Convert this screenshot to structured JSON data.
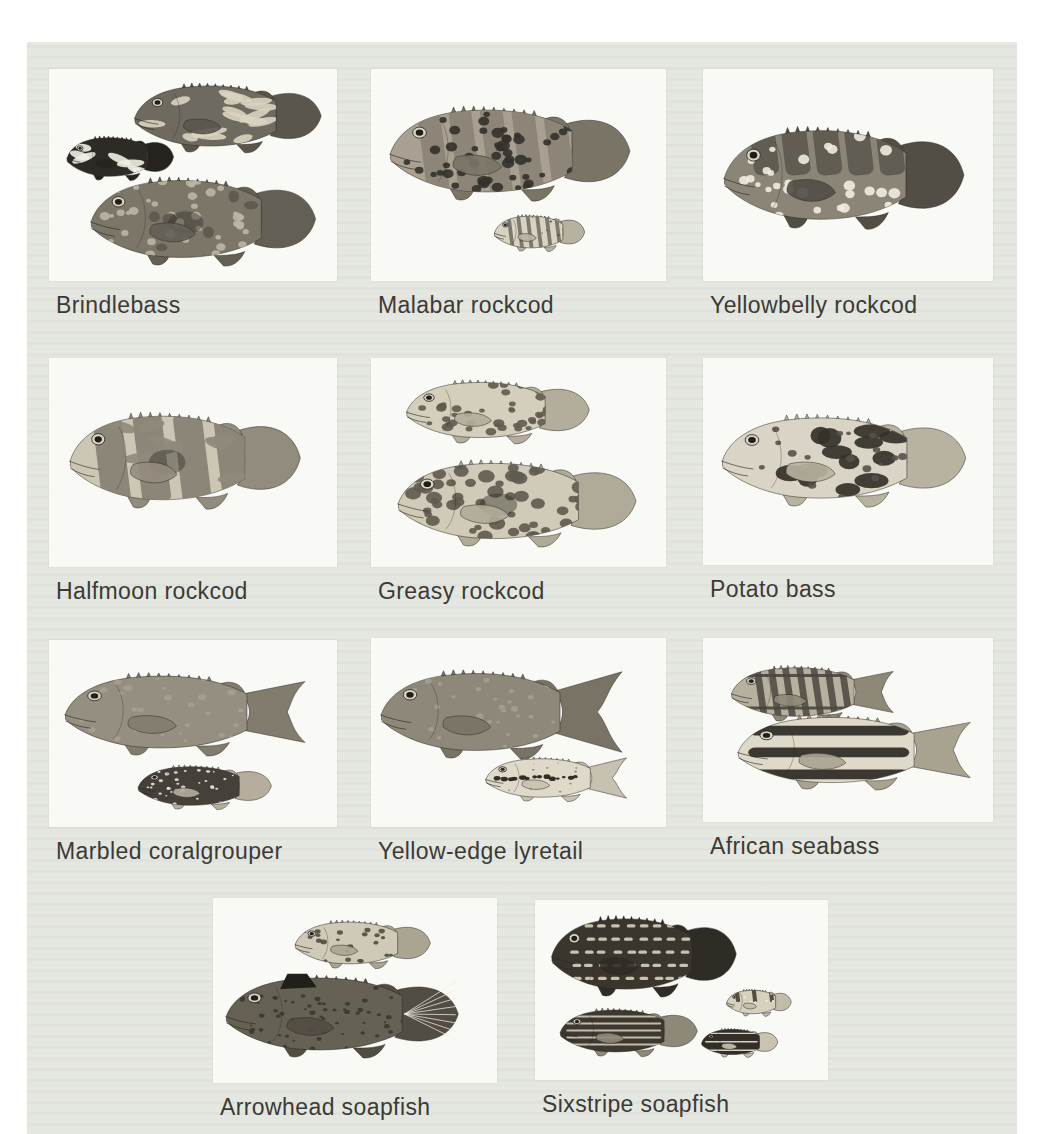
{
  "page": {
    "kind": "field-guide plate of fish illustrations",
    "margin_color": "#ffffff",
    "plate_background": "#e4e6e0",
    "panel_background": "#f9f9f6",
    "caption_color": "#3b3a35"
  },
  "species": [
    {
      "label": "Brindlebass",
      "panel": {
        "x": 49,
        "y": 69,
        "w": 288,
        "h": 212
      },
      "fish": [
        {
          "cx": 182,
          "cy": 47,
          "len": 196,
          "ht": 72,
          "tail": "round",
          "body": "#6e6a60",
          "fins": "#5a564d",
          "patterns": [
            {
              "t": "marble",
              "c": "#d9d3c1",
              "n": 18,
              "s": 5
            }
          ]
        },
        {
          "cx": 73,
          "cy": 88,
          "len": 112,
          "ht": 46,
          "tail": "round",
          "body": "#2e2b26",
          "fins": "#26231f",
          "patterns": [
            {
              "t": "marble",
              "c": "#f1eee4",
              "n": 7,
              "s": 8
            }
          ]
        },
        {
          "cx": 158,
          "cy": 150,
          "len": 236,
          "ht": 92,
          "tail": "round",
          "body": "#7c7669",
          "fins": "#645f54",
          "patterns": [
            {
              "t": "specks",
              "c": "#bdb6a4",
              "n": 44,
              "s": 1.6
            },
            {
              "t": "blotches",
              "c": "#5d584e",
              "n": 6,
              "s": 3.2
            }
          ],
          "extras": [
            "midblotch"
          ]
        }
      ]
    },
    {
      "label": "Malabar rockcod",
      "panel": {
        "x": 371,
        "y": 69,
        "w": 295,
        "h": 212
      },
      "fish": [
        {
          "cx": 143,
          "cy": 82,
          "len": 252,
          "ht": 98,
          "tail": "round",
          "body": "#a8a191",
          "fins": "#7a7467",
          "patterns": [
            {
              "t": "bars",
              "c": "#878073",
              "n": 5,
              "s": 9
            },
            {
              "t": "spots",
              "c": "#33312b",
              "n": 55,
              "s": 1.9
            }
          ]
        },
        {
          "cx": 170,
          "cy": 163,
          "len": 95,
          "ht": 38,
          "tail": "round",
          "body": "#d8d2c1",
          "fins": "#b7b1a0",
          "patterns": [
            {
              "t": "bars",
              "c": "#6e6a5f",
              "n": 6,
              "s": 4
            },
            {
              "t": "spots",
              "c": "#4a463e",
              "n": 10,
              "s": 1
            }
          ]
        }
      ]
    },
    {
      "label": "Yellowbelly rockcod",
      "panel": {
        "x": 703,
        "y": 69,
        "w": 290,
        "h": 212
      },
      "fish": [
        {
          "cx": 145,
          "cy": 106,
          "len": 252,
          "ht": 106,
          "tail": "round",
          "body": "#8b8578",
          "fins": "#524e45",
          "patterns": [
            {
              "t": "saddles",
              "c": "#5a564c",
              "n": 5,
              "s": 10
            },
            {
              "t": "spots",
              "c": "#efecdf",
              "n": 30,
              "s": 1.7
            }
          ]
        }
      ]
    },
    {
      "label": "Halfmoon rockcod",
      "panel": {
        "x": 49,
        "y": 358,
        "w": 288,
        "h": 209
      },
      "fish": [
        {
          "cx": 140,
          "cy": 100,
          "len": 242,
          "ht": 100,
          "tail": "round",
          "body": "#ccc6b5",
          "fins": "#928c7e",
          "patterns": [
            {
              "t": "bars",
              "c": "#7f7a6d",
              "n": 4,
              "s": 12
            },
            {
              "t": "marble",
              "c": "#8f897b",
              "n": 8,
              "s": 5
            }
          ],
          "extras": [
            "midblotch"
          ]
        }
      ]
    },
    {
      "label": "Greasy rockcod",
      "panel": {
        "x": 371,
        "y": 358,
        "w": 295,
        "h": 209
      },
      "fish": [
        {
          "cx": 130,
          "cy": 52,
          "len": 192,
          "ht": 66,
          "tail": "round",
          "body": "#d4cebc",
          "fins": "#b3ad9b",
          "patterns": [
            {
              "t": "spots",
              "c": "#5f5a4f",
              "n": 40,
              "s": 2.2
            }
          ]
        },
        {
          "cx": 150,
          "cy": 143,
          "len": 250,
          "ht": 90,
          "tail": "round",
          "body": "#d0cab8",
          "fins": "#b0aa98",
          "patterns": [
            {
              "t": "spots",
              "c": "#5f5a4f",
              "n": 58,
              "s": 2.4
            }
          ],
          "extras": [
            "midblotch"
          ]
        }
      ]
    },
    {
      "label": "Potato bass",
      "panel": {
        "x": 703,
        "y": 358,
        "w": 290,
        "h": 207
      },
      "fish": [
        {
          "cx": 145,
          "cy": 100,
          "len": 256,
          "ht": 96,
          "tail": "round",
          "body": "#d9d4c5",
          "fins": "#b8b2a1",
          "patterns": [
            {
              "t": "blotches",
              "c": "#343129",
              "n": 13,
              "s": 5.5
            },
            {
              "t": "spots",
              "c": "#55514a",
              "n": 22,
              "s": 1.3
            }
          ]
        }
      ]
    },
    {
      "label": "Marbled coralgrouper",
      "panel": {
        "x": 49,
        "y": 640,
        "w": 288,
        "h": 187
      },
      "fish": [
        {
          "cx": 140,
          "cy": 72,
          "len": 252,
          "ht": 86,
          "tail": "fork",
          "body": "#958f82",
          "fins": "#827c6f",
          "patterns": [
            {
              "t": "specks",
              "c": "#a79f8f",
              "n": 30,
              "s": 1.2
            }
          ]
        },
        {
          "cx": 158,
          "cy": 146,
          "len": 140,
          "ht": 46,
          "tail": "round",
          "body": "#45403a",
          "fins": "#b5ae9e",
          "patterns": [
            {
              "t": "spots",
              "c": "#e9e5d8",
              "n": 40,
              "s": 1.2
            }
          ]
        }
      ]
    },
    {
      "label": "Yellow-edge lyretail",
      "panel": {
        "x": 371,
        "y": 638,
        "w": 295,
        "h": 189
      },
      "fish": [
        {
          "cx": 132,
          "cy": 74,
          "len": 248,
          "ht": 92,
          "tail": "lyre",
          "body": "#8e887b",
          "fins": "#797365",
          "patterns": [
            {
              "t": "specks",
              "c": "#a59e8e",
              "n": 36,
              "s": 1.1
            }
          ]
        },
        {
          "cx": 186,
          "cy": 140,
          "len": 145,
          "ht": 46,
          "tail": "lyre",
          "body": "#ded9c9",
          "fins": "#c6c1b0",
          "patterns": [
            {
              "t": "midstripe",
              "c": "#28251f",
              "n": 14,
              "s": 2.4
            },
            {
              "t": "specks",
              "c": "#8b8577",
              "n": 20,
              "s": 0.8
            }
          ]
        }
      ]
    },
    {
      "label": "African seabass",
      "panel": {
        "x": 703,
        "y": 638,
        "w": 290,
        "h": 184
      },
      "fish": [
        {
          "cx": 112,
          "cy": 54,
          "len": 170,
          "ht": 58,
          "tail": "fork",
          "body": "#b7b09f",
          "fins": "#8e8878",
          "patterns": [
            {
              "t": "bars",
              "c": "#4b4640",
              "n": 7,
              "s": 4
            },
            {
              "t": "stripes",
              "c": "#4b4640",
              "n": 2,
              "s": 2.5
            }
          ]
        },
        {
          "cx": 155,
          "cy": 112,
          "len": 244,
          "ht": 78,
          "tail": "fork",
          "body": "#ded9c8",
          "fins": "#a8a291",
          "patterns": [
            {
              "t": "stripes",
              "c": "#2d2a24",
              "n": 3,
              "s": 6
            }
          ]
        }
      ]
    },
    {
      "label": "Arrowhead soapfish",
      "panel": {
        "x": 213,
        "y": 898,
        "w": 284,
        "h": 185
      },
      "fish": [
        {
          "cx": 152,
          "cy": 45,
          "len": 142,
          "ht": 50,
          "tail": "round",
          "body": "#cfc9b7",
          "fins": "#aaa492",
          "patterns": [
            {
              "t": "spots",
              "c": "#4f4b42",
              "n": 24,
              "s": 1.7
            }
          ]
        },
        {
          "cx": 133,
          "cy": 116,
          "len": 244,
          "ht": 86,
          "tail": "round",
          "body": "#666155",
          "fins": "#524d43",
          "patterns": [
            {
              "t": "specks",
              "c": "#3b382f",
              "n": 70,
              "s": 0.9
            }
          ],
          "extras": [
            "tailrays",
            "darknape"
          ]
        }
      ]
    },
    {
      "label": "Sixstripe soapfish",
      "panel": {
        "x": 535,
        "y": 900,
        "w": 293,
        "h": 180
      },
      "fish": [
        {
          "cx": 112,
          "cy": 54,
          "len": 194,
          "ht": 84,
          "tail": "round",
          "body": "#3a362d",
          "fins": "#2f2c25",
          "patterns": [
            {
              "t": "dashes",
              "c": "#d7d1bf",
              "n": 5,
              "s": 4.5
            }
          ]
        },
        {
          "cx": 96,
          "cy": 131,
          "len": 144,
          "ht": 50,
          "tail": "round",
          "body": "#3d3931",
          "fins": "#8e8878",
          "patterns": [
            {
              "t": "stripes",
              "c": "#cdc7b5",
              "n": 5,
              "s": 2
            }
          ]
        },
        {
          "cx": 225,
          "cy": 102,
          "len": 68,
          "ht": 28,
          "tail": "round",
          "body": "#d6d0bf",
          "fins": "#c2bcab",
          "patterns": [
            {
              "t": "saddles",
              "c": "#3b372e",
              "n": 3,
              "s": 6
            },
            {
              "t": "spots",
              "c": "#f5f2e8",
              "n": 8,
              "s": 1.5
            }
          ]
        },
        {
          "cx": 206,
          "cy": 142,
          "len": 80,
          "ht": 30,
          "tail": "round",
          "body": "#322f28",
          "fins": "#c9c3b2",
          "patterns": [
            {
              "t": "stripes",
              "c": "#e6e1d2",
              "n": 3,
              "s": 2.2
            }
          ]
        }
      ]
    }
  ]
}
